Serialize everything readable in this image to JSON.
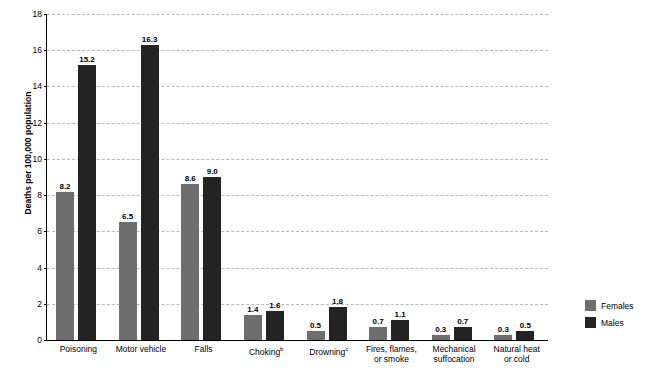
{
  "chart_data": {
    "type": "bar",
    "title": "",
    "xlabel": "",
    "ylabel": "Deaths per 100,000 population",
    "ylim": [
      0,
      18
    ],
    "yticks": [
      0,
      2,
      4,
      6,
      8,
      10,
      12,
      14,
      16,
      18
    ],
    "grid": true,
    "legend_position": "right",
    "categories": [
      "Poisoning",
      "Motor vehicle",
      "Falls",
      "Choking",
      "Drowning",
      "Fires, flames, or smoke",
      "Mechanical suffocation",
      "Natural heat or cold"
    ],
    "category_footnotes": [
      "",
      "",
      "",
      "b",
      "c",
      "",
      "",
      ""
    ],
    "category_lines": [
      [
        "Poisoning"
      ],
      [
        "Motor vehicle"
      ],
      [
        "Falls"
      ],
      [
        "Choking"
      ],
      [
        "Drowning"
      ],
      [
        "Fires, flames,",
        "or smoke"
      ],
      [
        "Mechanical",
        "suffocation"
      ],
      [
        "Natural heat",
        "or cold"
      ]
    ],
    "series": [
      {
        "name": "Females",
        "color": "#6e6e6e",
        "values": [
          8.2,
          6.5,
          8.6,
          1.4,
          0.5,
          0.7,
          0.3,
          0.3
        ]
      },
      {
        "name": "Males",
        "color": "#232323",
        "values": [
          15.2,
          16.3,
          9.0,
          1.6,
          1.8,
          1.1,
          0.7,
          0.5
        ]
      }
    ],
    "value_labels": {
      "Females": [
        "8.2",
        "6.5",
        "8.6",
        "1.4",
        "0.5",
        "0.7",
        "0.3",
        "0.3"
      ],
      "Males": [
        "15.2",
        "16.3",
        "9.0",
        "1.6",
        "1.8",
        "1.1",
        "0.7",
        "0.5"
      ]
    }
  },
  "legend": {
    "items": [
      {
        "label": "Females"
      },
      {
        "label": "Males"
      }
    ]
  },
  "top_caption": ""
}
